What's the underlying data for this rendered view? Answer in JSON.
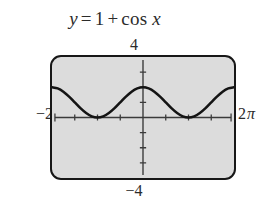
{
  "title": {
    "lhs": "y",
    "equals": "=",
    "constant": "1",
    "plus": "+",
    "func": "cos",
    "variable": "x",
    "full": "y = 1 + cos x"
  },
  "axis_labels": {
    "top": "4",
    "bottom": "−4",
    "left_number": "−2",
    "left_pi": "π",
    "right_number": "2",
    "right_pi": "π",
    "left_full": "−2π",
    "right_full": "2π"
  },
  "colors": {
    "window_fill": "#dcdcdc",
    "window_border": "#171717",
    "curve": "#141414",
    "axis": "#3a3a3a",
    "text": "#2b2b2b",
    "page_background": "#ffffff"
  },
  "chart_data": {
    "type": "line",
    "xlabel": "",
    "ylabel": "",
    "equation": "y = 1 + cos(x)",
    "xlim": [
      -6.283185,
      6.283185
    ],
    "ylim": [
      -4,
      4
    ],
    "xlim_labels": [
      "−2π",
      "2π"
    ],
    "ylim_labels": [
      "−4",
      "4"
    ],
    "grid": false,
    "legend": "none",
    "x_tick_spacing": 1.570796,
    "x_tick_spacing_label": "π/2",
    "y_tick_spacing": 1,
    "amplitude": 1,
    "vertical_shift": 1,
    "period": 6.283185,
    "period_label": "2π",
    "range": [
      0,
      2
    ],
    "key_points": [
      {
        "x": -6.283185,
        "y": 2,
        "x_label": "−2π",
        "kind": "maximum"
      },
      {
        "x": -3.141593,
        "y": 0,
        "x_label": "−π",
        "kind": "minimum"
      },
      {
        "x": 0,
        "y": 2,
        "x_label": "0",
        "kind": "maximum"
      },
      {
        "x": 3.141593,
        "y": 0,
        "x_label": "π",
        "kind": "minimum"
      },
      {
        "x": 6.283185,
        "y": 2,
        "x_label": "2π",
        "kind": "maximum"
      }
    ],
    "x": [
      -6.283185,
      -5.890486,
      -5.497787,
      -5.105088,
      -4.712389,
      -4.31969,
      -3.926991,
      -3.534292,
      -3.141593,
      -2.748894,
      -2.356194,
      -1.963495,
      -1.570796,
      -1.178097,
      -0.785398,
      -0.392699,
      0,
      0.392699,
      0.785398,
      1.178097,
      1.570796,
      1.963495,
      2.356194,
      2.748894,
      3.141593,
      3.534292,
      3.926991,
      4.31969,
      4.712389,
      5.105088,
      5.497787,
      5.890486,
      6.283185
    ],
    "y": [
      2,
      1.924,
      1.707,
      1.383,
      1,
      0.617,
      0.293,
      0.076,
      0,
      0.076,
      0.293,
      0.617,
      1,
      1.383,
      1.707,
      1.924,
      2,
      1.924,
      1.707,
      1.383,
      1,
      0.617,
      0.293,
      0.076,
      0,
      0.076,
      0.293,
      0.617,
      1,
      1.383,
      1.707,
      1.924,
      2
    ]
  }
}
